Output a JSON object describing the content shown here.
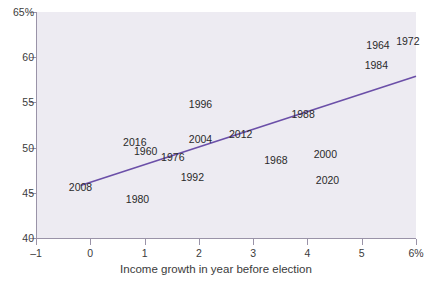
{
  "chart_data": {
    "type": "scatter",
    "title": "",
    "xlabel": "Income growth in year before election",
    "ylabel": "",
    "xlim": [
      -1,
      6
    ],
    "ylim": [
      40,
      65
    ],
    "grid": false,
    "legend": "none",
    "x_ticks": [
      {
        "value": -1,
        "label": "–1"
      },
      {
        "value": 0,
        "label": "0"
      },
      {
        "value": 1,
        "label": "1"
      },
      {
        "value": 2,
        "label": "2"
      },
      {
        "value": 3,
        "label": "3"
      },
      {
        "value": 4,
        "label": "4"
      },
      {
        "value": 5,
        "label": "5"
      },
      {
        "value": 6,
        "label": "6%"
      }
    ],
    "y_ticks": [
      {
        "value": 65,
        "label": "65%"
      },
      {
        "value": 60,
        "label": "60"
      },
      {
        "value": 55,
        "label": "55"
      },
      {
        "value": 50,
        "label": "50"
      },
      {
        "value": 45,
        "label": "45"
      },
      {
        "value": 40,
        "label": "40"
      }
    ],
    "point_label_style": "year-text",
    "points": [
      {
        "label": "1964",
        "x": 5.3,
        "y": 61.4
      },
      {
        "label": "1972",
        "x": 5.85,
        "y": 61.8
      },
      {
        "label": "1984",
        "x": 5.27,
        "y": 59.1
      },
      {
        "label": "1996",
        "x": 2.03,
        "y": 54.8
      },
      {
        "label": "1988",
        "x": 3.92,
        "y": 53.7
      },
      {
        "label": "2012",
        "x": 2.77,
        "y": 51.5
      },
      {
        "label": "2004",
        "x": 2.03,
        "y": 51.0
      },
      {
        "label": "2016",
        "x": 0.82,
        "y": 50.6
      },
      {
        "label": "1960",
        "x": 1.02,
        "y": 49.6
      },
      {
        "label": "1976",
        "x": 1.52,
        "y": 49.0
      },
      {
        "label": "2000",
        "x": 4.33,
        "y": 49.3
      },
      {
        "label": "1968",
        "x": 3.42,
        "y": 48.6
      },
      {
        "label": "2020",
        "x": 4.37,
        "y": 46.4
      },
      {
        "label": "1992",
        "x": 1.88,
        "y": 46.7
      },
      {
        "label": "2008",
        "x": -0.18,
        "y": 45.6
      },
      {
        "label": "1980",
        "x": 0.87,
        "y": 44.3
      }
    ],
    "trend_line": {
      "x_start": -0.18,
      "y_start": 45.8,
      "x_end": 6.0,
      "y_end": 57.9,
      "color": "#6b4fa8"
    },
    "colors": {
      "plot_background": "#edebf2",
      "axis": "#9a93a8",
      "text": "#2a2a2a",
      "trend": "#6b4fa8"
    }
  }
}
